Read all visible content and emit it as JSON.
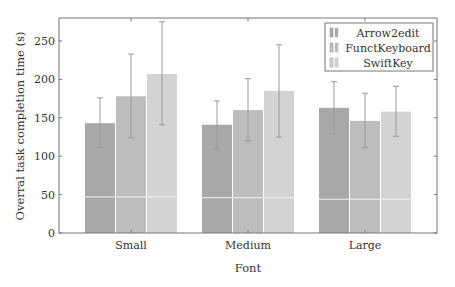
{
  "chart_data": {
    "type": "bar",
    "title": "",
    "xlabel": "Font",
    "ylabel": "Overral task completion time (s)",
    "categories": [
      "Small",
      "Medium",
      "Large"
    ],
    "ylim": [
      0,
      280
    ],
    "yticks": [
      0,
      50,
      100,
      150,
      200,
      250
    ],
    "grid": false,
    "legend_position": "upper right",
    "series": [
      {
        "name": "Arrow2edit",
        "color": "#a8a8a8",
        "values": [
          143,
          141,
          163
        ],
        "error_low": [
          111,
          109,
          129
        ],
        "error_high": [
          176,
          172,
          197
        ],
        "inner_line": [
          47,
          46,
          44
        ]
      },
      {
        "name": "FunctKeyboard",
        "color": "#bdbdbd",
        "values": [
          178,
          160,
          146
        ],
        "error_low": [
          124,
          120,
          111
        ],
        "error_high": [
          233,
          201,
          182
        ],
        "inner_line": [
          47,
          46,
          44
        ]
      },
      {
        "name": "SwiftKey",
        "color": "#d3d3d3",
        "values": [
          207,
          185,
          158
        ],
        "error_low": [
          141,
          125,
          126
        ],
        "error_high": [
          275,
          245,
          191
        ],
        "inner_line": [
          47,
          46,
          44
        ]
      }
    ]
  },
  "colors": {
    "axis": "#777777",
    "error_bar": "#9a9a9a",
    "inner_line": "#f2f2f2",
    "legend_border": "#777777"
  }
}
